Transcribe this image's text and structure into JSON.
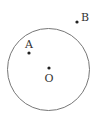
{
  "diagram": {
    "circle": {
      "cx": 48.5,
      "cy": 69.5,
      "r": 41,
      "stroke": "#777777"
    },
    "points": [
      {
        "name": "O",
        "x": 49,
        "y": 68,
        "label": "O",
        "lx": 44.5,
        "ly": 82
      },
      {
        "name": "A",
        "x": 29,
        "y": 53,
        "label": "A",
        "lx": 25,
        "ly": 48
      },
      {
        "name": "B",
        "x": 77,
        "y": 22,
        "label": "B",
        "lx": 81,
        "ly": 21
      }
    ],
    "point_color": "#222222"
  }
}
